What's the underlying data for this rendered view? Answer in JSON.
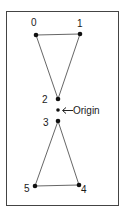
{
  "diagram": {
    "frame": {
      "x": 6,
      "y": 11,
      "width": 112,
      "height": 194,
      "stroke": "#444444"
    },
    "points": [
      {
        "id": "0",
        "label": "0",
        "x": 36,
        "y": 35
      },
      {
        "id": "1",
        "label": "1",
        "x": 80,
        "y": 34
      },
      {
        "id": "2",
        "label": "2",
        "x": 58,
        "y": 99
      },
      {
        "id": "3",
        "label": "3",
        "x": 58,
        "y": 121
      },
      {
        "id": "4",
        "label": "4",
        "x": 79,
        "y": 185
      },
      {
        "id": "5",
        "label": "5",
        "x": 35,
        "y": 186
      }
    ],
    "origin": {
      "x": 58,
      "y": 110,
      "label": "Origin"
    },
    "edges": [
      [
        "0",
        "1"
      ],
      [
        "1",
        "2"
      ],
      [
        "2",
        "0"
      ],
      [
        "3",
        "4"
      ],
      [
        "4",
        "5"
      ],
      [
        "5",
        "3"
      ]
    ],
    "colors": {
      "line": "#555555",
      "point": "#111111",
      "text": "#1a1a1a"
    }
  }
}
